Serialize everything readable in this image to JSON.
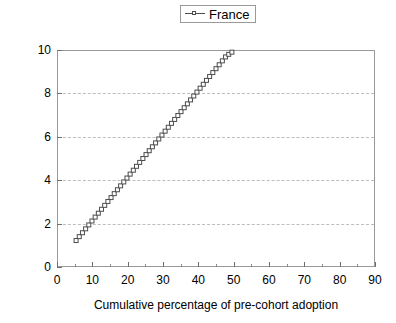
{
  "chart_data": {
    "type": "line",
    "title": "",
    "xlabel": "Cumulative percentage of pre-cohort adoption",
    "ylabel": "Predicted effect",
    "xlim": [
      0,
      90
    ],
    "ylim": [
      0,
      10
    ],
    "xticks": [
      0,
      10,
      20,
      30,
      40,
      50,
      60,
      70,
      80,
      90
    ],
    "yticks": [
      0,
      2,
      4,
      6,
      8,
      10
    ],
    "grid": "horizontal-dashed",
    "legend_position": "top-center",
    "marker": "open-square",
    "series": [
      {
        "name": "France",
        "color": "#4d4d4d",
        "x": [
          5.4,
          6.3,
          7.2,
          8.1,
          9.0,
          9.9,
          10.8,
          11.7,
          12.6,
          13.5,
          14.4,
          15.3,
          16.2,
          17.1,
          18.0,
          18.9,
          19.8,
          20.7,
          21.6,
          22.5,
          23.4,
          24.3,
          25.2,
          26.1,
          27.0,
          27.9,
          28.8,
          29.7,
          30.6,
          31.5,
          32.4,
          33.3,
          34.2,
          35.1,
          36.0,
          36.9,
          37.8,
          38.7,
          39.6,
          40.5,
          41.4,
          42.3,
          43.2,
          44.1,
          45.0,
          45.9,
          46.8,
          47.7,
          48.6,
          49.5
        ],
        "y": [
          1.22,
          1.4,
          1.58,
          1.76,
          1.94,
          2.12,
          2.3,
          2.48,
          2.66,
          2.84,
          3.02,
          3.2,
          3.38,
          3.56,
          3.74,
          3.92,
          4.1,
          4.28,
          4.46,
          4.64,
          4.82,
          5.0,
          5.18,
          5.36,
          5.54,
          5.72,
          5.9,
          6.08,
          6.26,
          6.44,
          6.62,
          6.8,
          6.98,
          7.16,
          7.34,
          7.52,
          7.7,
          7.88,
          8.06,
          8.24,
          8.42,
          8.6,
          8.78,
          8.96,
          9.14,
          9.32,
          9.5,
          9.68,
          9.8,
          9.9
        ]
      }
    ]
  },
  "legend": {
    "entries": [
      {
        "label": "France"
      }
    ]
  },
  "axes": {
    "y_label": "Predicted effect",
    "x_label": "Cumulative percentage of pre-cohort adoption",
    "y_tick_labels": [
      "0",
      "2",
      "4",
      "6",
      "8",
      "10"
    ],
    "x_tick_labels": [
      "0",
      "10",
      "20",
      "30",
      "40",
      "50",
      "60",
      "70",
      "80",
      "90"
    ]
  },
  "colors": {
    "series": "#4d4d4d",
    "grid": "#bdbdbd",
    "axis": "#9a9a9a",
    "background": "#ffffff"
  }
}
